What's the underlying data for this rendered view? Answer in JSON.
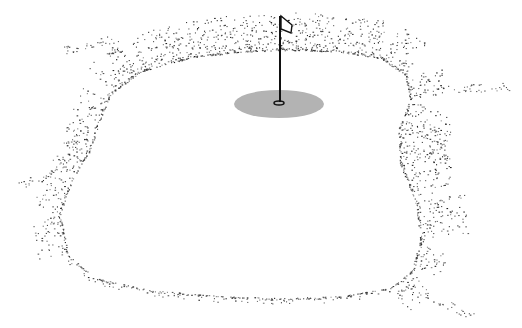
{
  "illustration": {
    "subject": "golf green with flagstick",
    "style": "black ink stipple",
    "colors": {
      "background": "#ffffff",
      "ink": "#1a1a1a",
      "cup_shadow": "#b3b3b3"
    },
    "cup_area": {
      "cx": 279,
      "cy": 104,
      "rx": 45,
      "ry": 14
    },
    "cup": {
      "cx": 279,
      "cy": 103,
      "rx": 5,
      "ry": 2
    },
    "flagstick": {
      "x": 280,
      "y_top": 16,
      "y_bottom": 102
    },
    "flag": {
      "points": "281,16 292,25 291,33 281,29"
    }
  }
}
